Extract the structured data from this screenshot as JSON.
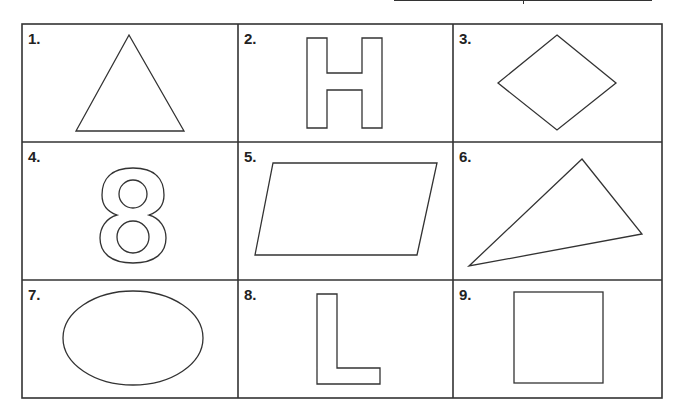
{
  "worksheet": {
    "grid": {
      "rows": 3,
      "cols": 3
    },
    "cells": [
      {
        "label": "1.",
        "shape": "triangle"
      },
      {
        "label": "2.",
        "shape": "letter-H"
      },
      {
        "label": "3.",
        "shape": "rhombus"
      },
      {
        "label": "4.",
        "shape": "digit-8"
      },
      {
        "label": "5.",
        "shape": "parallelogram"
      },
      {
        "label": "6.",
        "shape": "scalene-triangle"
      },
      {
        "label": "7.",
        "shape": "ellipse"
      },
      {
        "label": "8.",
        "shape": "letter-L"
      },
      {
        "label": "9.",
        "shape": "square"
      }
    ]
  },
  "colors": {
    "stroke": "#333333",
    "background": "#ffffff"
  }
}
